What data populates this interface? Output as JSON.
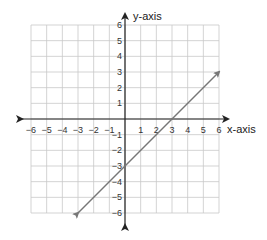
{
  "chart_data": {
    "type": "line",
    "title": "",
    "xlabel": "x-axis",
    "ylabel": "y-axis",
    "xlim": [
      -6,
      6
    ],
    "ylim": [
      -6,
      6
    ],
    "grid": true,
    "x_ticks": [
      -6,
      -5,
      -4,
      -3,
      -2,
      -1,
      1,
      2,
      3,
      4,
      5,
      6
    ],
    "y_ticks": [
      -6,
      -5,
      -4,
      -3,
      -2,
      -1,
      1,
      2,
      3,
      4,
      5,
      6
    ],
    "x_tick_labels": [
      "−6",
      "−5",
      "−4",
      "−3",
      "−2",
      "−1",
      "1",
      "2",
      "3",
      "4",
      "5",
      "6"
    ],
    "y_tick_labels": [
      "−6",
      "−5",
      "−4",
      "−3",
      "−2",
      "−1",
      "1",
      "2",
      "3",
      "4",
      "5",
      "6"
    ],
    "series": [
      {
        "name": "line",
        "equation": "y = x - 3",
        "x": [
          -3,
          0,
          3,
          6
        ],
        "y": [
          -6,
          -3,
          0,
          3
        ],
        "arrows_both_ends": true
      }
    ],
    "colors": {
      "grid": "#c8c8c8",
      "axes": "#222222",
      "line": "#777777"
    }
  }
}
